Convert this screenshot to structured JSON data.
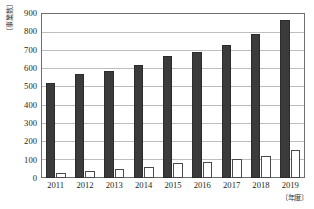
{
  "chart_data": {
    "type": "bar",
    "title": "",
    "xlabel": "〔年度〕",
    "ylabel": "〔事業数〕",
    "categories": [
      "2011",
      "2012",
      "2013",
      "2014",
      "2015",
      "2016",
      "2017",
      "2018",
      "2019"
    ],
    "series": [
      {
        "name": "dark-series",
        "color": "#3b3b3b",
        "values": [
          520,
          565,
          585,
          615,
          665,
          685,
          725,
          785,
          860
        ]
      },
      {
        "name": "white-series",
        "color": "#ffffff",
        "values": [
          30,
          38,
          48,
          60,
          80,
          85,
          102,
          122,
          152
        ]
      }
    ],
    "ylim": [
      0,
      900
    ],
    "ytick_step": 100,
    "yticks": [
      "900",
      "800",
      "700",
      "600",
      "500",
      "400",
      "300",
      "200",
      "100",
      "0"
    ],
    "grid": true,
    "legend": "none"
  }
}
